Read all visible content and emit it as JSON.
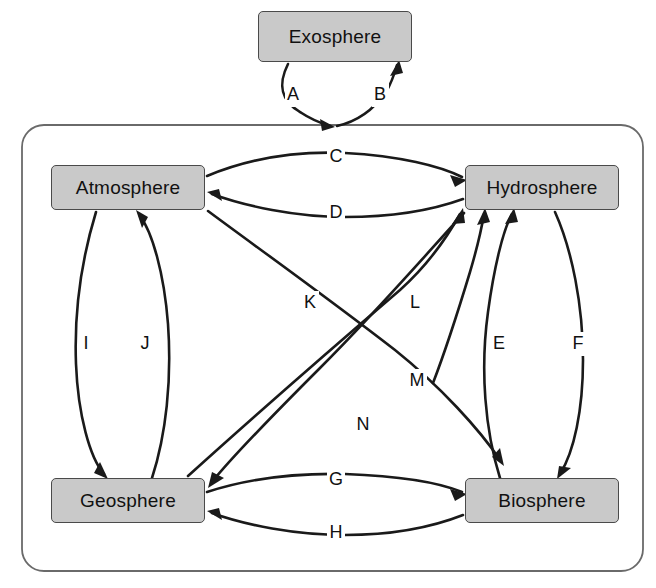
{
  "diagram": {
    "type": "earth-systems-interaction-diagram",
    "outer_node": {
      "id": "exosphere",
      "label": "Exosphere",
      "x": 258,
      "y": 11,
      "w": 154,
      "h": 51
    },
    "container": {
      "name": "earth-system-boundary",
      "x": 22,
      "y": 125,
      "w": 621,
      "h": 446,
      "radius": 22
    },
    "nodes": [
      {
        "id": "atmosphere",
        "label": "Atmosphere",
        "x": 51,
        "y": 165,
        "w": 154,
        "h": 45
      },
      {
        "id": "hydrosphere",
        "label": "Hydrosphere",
        "x": 465,
        "y": 165,
        "w": 154,
        "h": 45
      },
      {
        "id": "geosphere",
        "label": "Geosphere",
        "x": 51,
        "y": 478,
        "w": 154,
        "h": 45
      },
      {
        "id": "biosphere",
        "label": "Biosphere",
        "x": 465,
        "y": 478,
        "w": 154,
        "h": 45
      }
    ],
    "edges": [
      {
        "letter": "A",
        "from": "exosphere",
        "to": "earth-system",
        "label_x": 293,
        "label_y": 95
      },
      {
        "letter": "B",
        "from": "earth-system",
        "to": "exosphere",
        "label_x": 380,
        "label_y": 95
      },
      {
        "letter": "C",
        "from": "atmosphere",
        "to": "hydrosphere",
        "label_x": 336,
        "label_y": 157
      },
      {
        "letter": "D",
        "from": "hydrosphere",
        "to": "atmosphere",
        "label_x": 336,
        "label_y": 213
      },
      {
        "letter": "E",
        "from": "biosphere",
        "to": "hydrosphere",
        "label_x": 499,
        "label_y": 344
      },
      {
        "letter": "F",
        "from": "hydrosphere",
        "to": "biosphere",
        "label_x": 578,
        "label_y": 344
      },
      {
        "letter": "G",
        "from": "geosphere",
        "to": "biosphere",
        "label_x": 336,
        "label_y": 480
      },
      {
        "letter": "H",
        "from": "biosphere",
        "to": "geosphere",
        "label_x": 336,
        "label_y": 533
      },
      {
        "letter": "I",
        "from": "atmosphere",
        "to": "geosphere",
        "label_x": 86,
        "label_y": 344
      },
      {
        "letter": "J",
        "from": "geosphere",
        "to": "atmosphere",
        "label_x": 145,
        "label_y": 344
      },
      {
        "letter": "K",
        "from": "geosphere",
        "to": "hydrosphere",
        "label_x": 310,
        "label_y": 303
      },
      {
        "letter": "L",
        "from": "biosphere",
        "to": "hydrosphere",
        "label_x": 415,
        "label_y": 303
      },
      {
        "letter": "M",
        "from": "atmosphere",
        "to": "biosphere",
        "label_x": 417,
        "label_y": 381
      },
      {
        "letter": "N",
        "from": "hydrosphere",
        "to": "geosphere",
        "label_x": 363,
        "label_y": 425
      }
    ],
    "colors": {
      "node_fill": "#c9c9c9",
      "node_stroke": "#4a4a4a",
      "edge_stroke": "#1a1a1a",
      "container_stroke": "#6a6a6a",
      "background": "#ffffff",
      "text": "#111111"
    }
  }
}
